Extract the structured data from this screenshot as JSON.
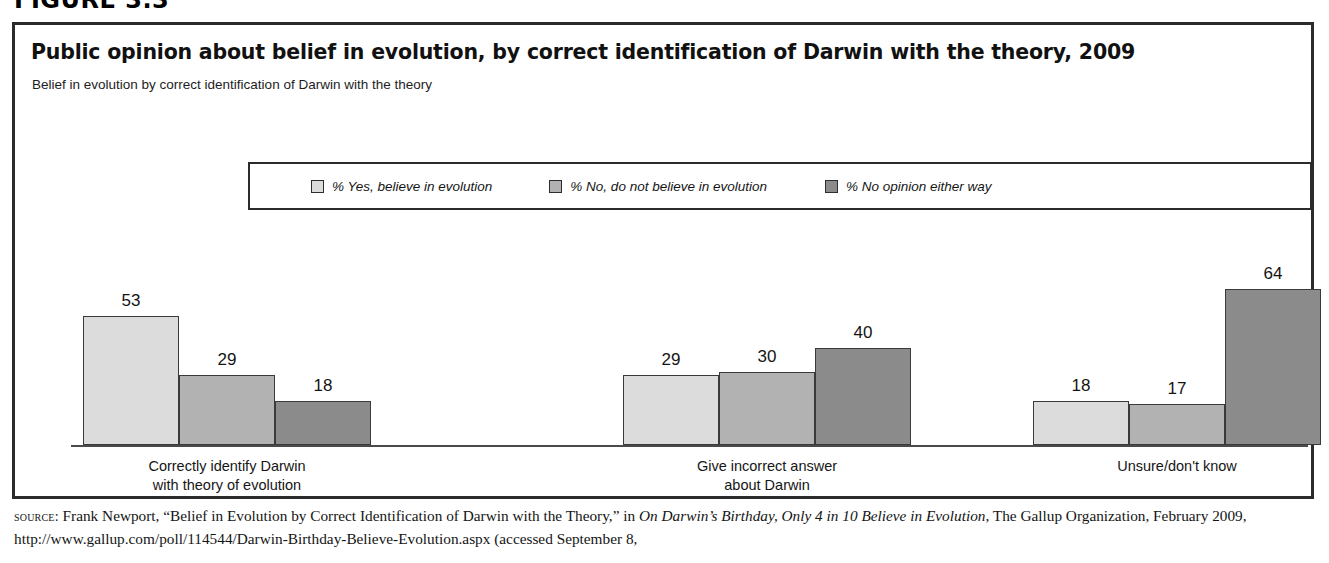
{
  "figure": {
    "number": "FIGURE 3.3"
  },
  "header": {
    "title": "Public opinion about belief in evolution, by correct identification of Darwin with the theory, 2009",
    "subtitle": "Belief in evolution by correct identification of Darwin with the theory"
  },
  "legend": {
    "items": [
      {
        "label": "% Yes, believe in evolution",
        "color": "#dcdcdc"
      },
      {
        "label": "% No, do not believe in evolution",
        "color": "#b2b2b2"
      },
      {
        "label": "% No opinion either way",
        "color": "#8b8b8b"
      }
    ]
  },
  "source": {
    "label": "source:",
    "text_1": " Frank Newport, “Belief in Evolution by Correct Identification of Darwin with the Theory,” in ",
    "italic_1": "On Darwin’s Birthday, Only 4 in 10 Believe in Evolution",
    "text_2": ", The Gallup Organization, February 2009, http://www.gallup.com/poll/114544/Darwin-Birthday-Believe-Evolution.aspx (accessed September 8,"
  },
  "chart_data": {
    "type": "bar",
    "title": "Public opinion about belief in evolution, by correct identification of Darwin with the theory, 2009",
    "subtitle": "Belief in evolution by correct identification of Darwin with the theory",
    "xlabel": "",
    "ylabel": "",
    "ylim": [
      0,
      70
    ],
    "grid": false,
    "legend_position": "top-center",
    "categories": [
      "Correctly identify Darwin\nwith theory of evolution",
      "Give incorrect answer\nabout Darwin",
      "Unsure/don't know"
    ],
    "category_lines": [
      [
        "Correctly identify Darwin",
        "with theory of evolution"
      ],
      [
        "Give incorrect answer",
        "about Darwin"
      ],
      [
        "Unsure/don't know",
        ""
      ]
    ],
    "series": [
      {
        "name": "% Yes, believe in evolution",
        "color": "#dcdcdc",
        "values": [
          53,
          29,
          18
        ]
      },
      {
        "name": "% No, do not believe in evolution",
        "color": "#b2b2b2",
        "values": [
          29,
          30,
          17
        ]
      },
      {
        "name": "% No opinion either way",
        "color": "#8b8b8b",
        "values": [
          18,
          40,
          64
        ]
      }
    ]
  }
}
